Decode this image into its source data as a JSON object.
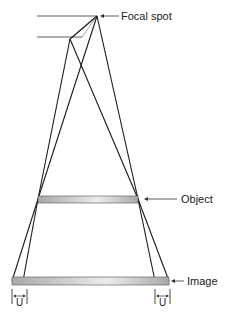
{
  "diagram": {
    "labels": {
      "focal_spot": "Focal spot",
      "object": "Object",
      "image": "Image",
      "unsharpness_left": "U",
      "unsharpness_right": "U"
    },
    "colors": {
      "line": "#1a1a1a",
      "bar_fill": "#bdbdbd",
      "bar_highlight": "#ececec"
    }
  }
}
